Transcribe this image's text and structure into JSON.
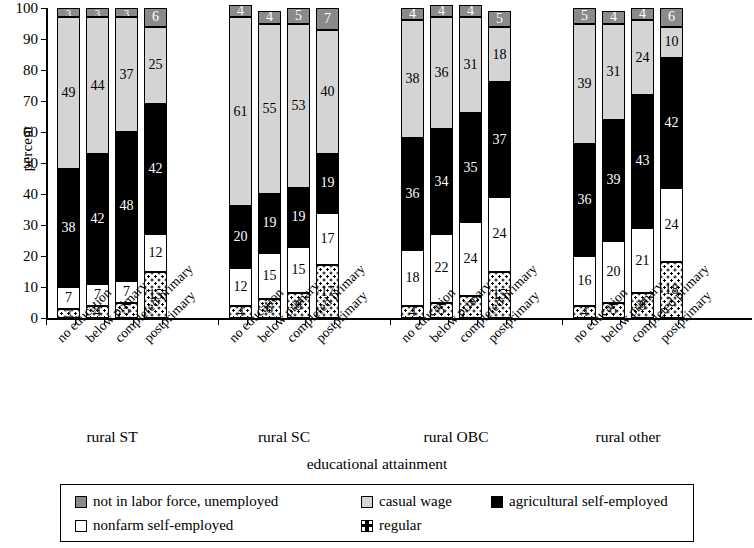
{
  "chart_data": {
    "type": "bar",
    "subtype": "stacked-percent",
    "title": "",
    "xlabel": "educational attainment",
    "ylabel": "percent",
    "ylim": [
      0,
      100
    ],
    "ytick_labels": [
      "0",
      "10",
      "20",
      "30",
      "40",
      "50",
      "60",
      "70",
      "80",
      "90",
      "100"
    ],
    "grid": false,
    "legend_position": "bottom",
    "groups": [
      "rural ST",
      "rural SC",
      "rural OBC",
      "rural other"
    ],
    "categories": [
      "no education",
      "below primary",
      "completed primary",
      "postprimary"
    ],
    "series": [
      {
        "name": "regular",
        "key": "regular",
        "color": "#ffffff",
        "pattern": "checked",
        "values": [
          [
            3,
            4,
            5,
            15
          ],
          [
            4,
            6,
            8,
            17
          ],
          [
            4,
            5,
            7,
            15
          ],
          [
            4,
            5,
            8,
            18
          ]
        ]
      },
      {
        "name": "nonfarm self-employed",
        "key": "nonfarm",
        "color": "#ffffff",
        "pattern": "solid",
        "values": [
          [
            7,
            7,
            7,
            12
          ],
          [
            12,
            15,
            15,
            17
          ],
          [
            18,
            22,
            24,
            24
          ],
          [
            16,
            20,
            21,
            24
          ]
        ]
      },
      {
        "name": "agricultural self-employed",
        "key": "agri",
        "color": "#000000",
        "pattern": "solid",
        "values": [
          [
            38,
            42,
            48,
            42
          ],
          [
            20,
            19,
            19,
            19
          ],
          [
            36,
            34,
            35,
            37
          ],
          [
            36,
            39,
            43,
            42
          ]
        ]
      },
      {
        "name": "casual wage",
        "key": "casual",
        "color": "#d4d4d4",
        "pattern": "solid",
        "values": [
          [
            49,
            44,
            37,
            25
          ],
          [
            61,
            55,
            53,
            40
          ],
          [
            38,
            36,
            31,
            18
          ],
          [
            39,
            31,
            24,
            10
          ]
        ]
      },
      {
        "name": "not in labor force, unemployed",
        "key": "nilf",
        "color": "#8a8a8a",
        "pattern": "solid",
        "values": [
          [
            3,
            3,
            3,
            6
          ],
          [
            4,
            4,
            5,
            7
          ],
          [
            4,
            4,
            4,
            5
          ],
          [
            5,
            4,
            4,
            6
          ]
        ]
      }
    ]
  },
  "axis": {
    "y_title": "percent",
    "x_title": "educational attainment"
  },
  "legend": {
    "items": [
      {
        "label": "not in labor force, unemployed",
        "swatch": "nilf"
      },
      {
        "label": "casual wage",
        "swatch": "casual"
      },
      {
        "label": "agricultural self-employed",
        "swatch": "agri"
      },
      {
        "label": "nonfarm self-employed",
        "swatch": "nonfarm"
      },
      {
        "label": "regular",
        "swatch": "regular"
      }
    ]
  }
}
